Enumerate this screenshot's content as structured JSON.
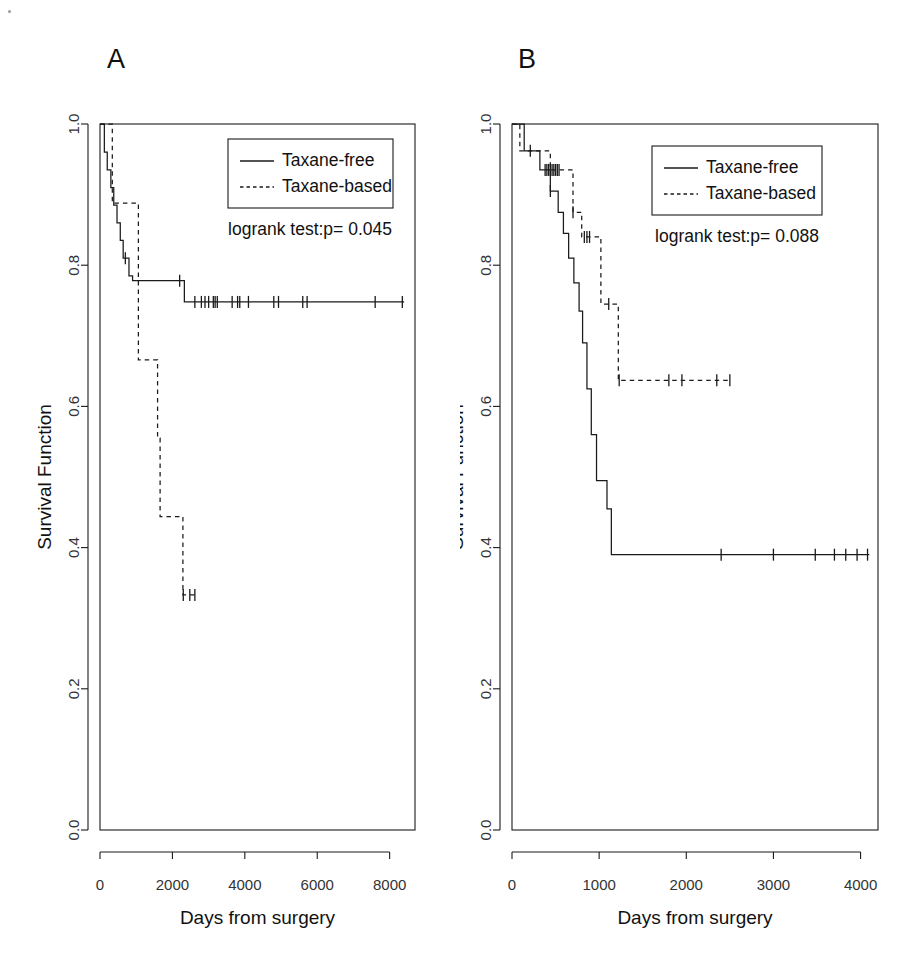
{
  "figure": {
    "background": "#ffffff",
    "line_color": "#1a1a1a",
    "panels": [
      {
        "letter": "A",
        "ylabel": "Survival Function",
        "xlabel": "Days from surgery",
        "pvalue_text": "logrank test:p= 0.045",
        "legend": {
          "items": [
            {
              "label": "Taxane-free",
              "style": "solid"
            },
            {
              "label": "Taxane-based",
              "style": "dashed"
            }
          ]
        },
        "xticks": [
          "0",
          "2000",
          "4000",
          "6000",
          "8000"
        ],
        "yticks": [
          "0.0",
          "0.2",
          "0.4",
          "0.6",
          "0.8",
          "1.0"
        ]
      },
      {
        "letter": "B",
        "ylabel": "Survival Function",
        "xlabel": "Days from surgery",
        "pvalue_text": "logrank test:p= 0.088",
        "legend": {
          "items": [
            {
              "label": "Taxane-free",
              "style": "solid"
            },
            {
              "label": "Taxane-based",
              "style": "dashed"
            }
          ]
        },
        "xticks": [
          "0",
          "1000",
          "2000",
          "3000",
          "4000"
        ],
        "yticks": [
          "0.0",
          "0.2",
          "0.4",
          "0.6",
          "0.8",
          "1.0"
        ]
      }
    ]
  },
  "chart_data": [
    {
      "type": "line",
      "panel": "A",
      "title": "A",
      "xlabel": "Days from surgery",
      "ylabel": "Survival Function",
      "xlim": [
        0,
        8700
      ],
      "ylim": [
        0.0,
        1.0
      ],
      "xticks": [
        0,
        2000,
        4000,
        6000,
        8000
      ],
      "yticks": [
        0.0,
        0.2,
        0.4,
        0.6,
        0.8,
        1.0
      ],
      "grid": false,
      "legend_position": "top-right",
      "annotations": [
        "logrank test:p= 0.045"
      ],
      "series": [
        {
          "name": "Taxane-free",
          "style": "solid",
          "steps": [
            [
              0,
              1.0
            ],
            [
              120,
              0.96
            ],
            [
              200,
              0.935
            ],
            [
              300,
              0.91
            ],
            [
              380,
              0.885
            ],
            [
              470,
              0.86
            ],
            [
              560,
              0.835
            ],
            [
              640,
              0.81
            ],
            [
              800,
              0.785
            ],
            [
              900,
              0.778
            ],
            [
              2250,
              0.778
            ],
            [
              2330,
              0.748
            ],
            [
              8400,
              0.748
            ]
          ],
          "censor_times": [
            700,
            2200,
            2620,
            2800,
            2900,
            3000,
            3130,
            3180,
            3240,
            3650,
            3800,
            3860,
            4100,
            4800,
            4930,
            5600,
            5720,
            7600,
            8350
          ],
          "final_survival": 0.748
        },
        {
          "name": "Taxane-based",
          "style": "dashed",
          "steps": [
            [
              0,
              1.0
            ],
            [
              330,
              1.0
            ],
            [
              340,
              0.888
            ],
            [
              1050,
              0.888
            ],
            [
              1060,
              0.666
            ],
            [
              1580,
              0.666
            ],
            [
              1590,
              0.555
            ],
            [
              1650,
              0.555
            ],
            [
              1660,
              0.444
            ],
            [
              2280,
              0.444
            ],
            [
              2290,
              0.333
            ],
            [
              2700,
              0.333
            ]
          ],
          "censor_times": [
            2300,
            2480,
            2620
          ],
          "final_survival": 0.333
        }
      ]
    },
    {
      "type": "line",
      "panel": "B",
      "title": "B",
      "xlabel": "Days from surgery",
      "ylabel": "Survival Function",
      "xlim": [
        0,
        4200
      ],
      "ylim": [
        0.0,
        1.0
      ],
      "xticks": [
        0,
        1000,
        2000,
        3000,
        4000
      ],
      "yticks": [
        0.0,
        0.2,
        0.4,
        0.6,
        0.8,
        1.0
      ],
      "grid": false,
      "legend_position": "top-right",
      "annotations": [
        "logrank test:p= 0.088"
      ],
      "series": [
        {
          "name": "Taxane-free",
          "style": "solid",
          "steps": [
            [
              0,
              1.0
            ],
            [
              130,
              1.0
            ],
            [
              140,
              0.962
            ],
            [
              310,
              0.962
            ],
            [
              320,
              0.935
            ],
            [
              430,
              0.935
            ],
            [
              440,
              0.905
            ],
            [
              520,
              0.905
            ],
            [
              530,
              0.875
            ],
            [
              580,
              0.875
            ],
            [
              590,
              0.845
            ],
            [
              640,
              0.845
            ],
            [
              650,
              0.81
            ],
            [
              700,
              0.81
            ],
            [
              710,
              0.775
            ],
            [
              760,
              0.775
            ],
            [
              770,
              0.735
            ],
            [
              800,
              0.735
            ],
            [
              810,
              0.69
            ],
            [
              855,
              0.69
            ],
            [
              860,
              0.625
            ],
            [
              900,
              0.625
            ],
            [
              910,
              0.56
            ],
            [
              960,
              0.56
            ],
            [
              970,
              0.495
            ],
            [
              1080,
              0.495
            ],
            [
              1090,
              0.455
            ],
            [
              1130,
              0.455
            ],
            [
              1140,
              0.39
            ],
            [
              4100,
              0.39
            ]
          ],
          "censor_times": [
            380,
            400,
            420,
            440,
            2400,
            3000,
            3480,
            3700,
            3830,
            3960,
            4080
          ],
          "final_survival": 0.39
        },
        {
          "name": "Taxane-based",
          "style": "dashed",
          "steps": [
            [
              0,
              1.0
            ],
            [
              80,
              1.0
            ],
            [
              90,
              0.962
            ],
            [
              430,
              0.962
            ],
            [
              440,
              0.935
            ],
            [
              690,
              0.935
            ],
            [
              700,
              0.875
            ],
            [
              790,
              0.875
            ],
            [
              800,
              0.84
            ],
            [
              1010,
              0.84
            ],
            [
              1020,
              0.745
            ],
            [
              1210,
              0.745
            ],
            [
              1220,
              0.637
            ],
            [
              2500,
              0.637
            ]
          ],
          "censor_times": [
            210,
            440,
            460,
            480,
            500,
            520,
            540,
            700,
            830,
            860,
            890,
            1110,
            1230,
            1800,
            1950,
            2350,
            2500
          ],
          "final_survival": 0.637
        }
      ]
    }
  ]
}
